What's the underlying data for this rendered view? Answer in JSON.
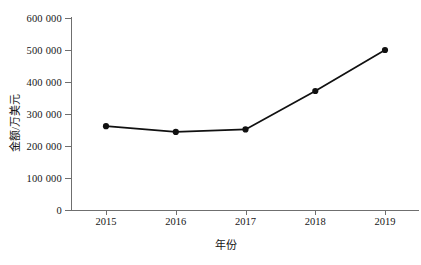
{
  "chart_data": {
    "type": "line",
    "title": "",
    "xlabel": "年份",
    "ylabel": "金额/万美元",
    "categories": [
      "2015",
      "2016",
      "2017",
      "2018",
      "2019"
    ],
    "values": [
      262000,
      244000,
      252000,
      372000,
      500000
    ],
    "series": [
      {
        "name": "金额",
        "values": [
          262000,
          244000,
          252000,
          372000,
          500000
        ]
      }
    ],
    "ylim": [
      0,
      600000
    ],
    "ytick_labels": [
      "0",
      "100 000",
      "200 000",
      "300 000",
      "400 000",
      "500 000",
      "600 000"
    ],
    "ytick_values": [
      0,
      100000,
      200000,
      300000,
      400000,
      500000,
      600000
    ],
    "xtick_labels": [
      "2015",
      "2016",
      "2017",
      "2018",
      "2019"
    ],
    "grid": false,
    "legend": "none",
    "marker": "filled-circle",
    "line_color": "#111111",
    "marker_color": "#111111",
    "axis_color": "#6f6f6f"
  }
}
